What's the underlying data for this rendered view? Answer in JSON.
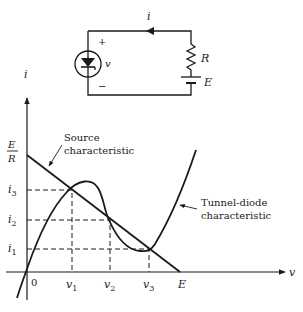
{
  "circuit": {
    "current_label": "i",
    "plus_label": "+",
    "minus_label": "−",
    "voltage_label": "v",
    "resistor_label": "R",
    "source_label": "E"
  },
  "graph": {
    "y_axis_label": "i",
    "x_axis_label": "v",
    "origin_label": "0",
    "y_ticks": {
      "er_num": "E",
      "er_den": "R",
      "i3": "i",
      "i3_sub": "3",
      "i2": "i",
      "i2_sub": "2",
      "i1": "i",
      "i1_sub": "1"
    },
    "x_ticks": {
      "v1": "v",
      "v1_sub": "1",
      "v2": "v",
      "v2_sub": "2",
      "v3": "v",
      "v3_sub": "3",
      "e": "E"
    },
    "annotations": {
      "source_line1": "Source",
      "source_line2": "characteristic",
      "diode_line1": "Tunnel-diode",
      "diode_line2": "characteristic"
    }
  }
}
